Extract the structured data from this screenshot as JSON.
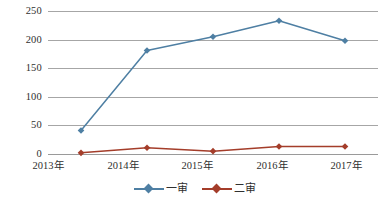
{
  "chart_data": {
    "type": "line",
    "title": "",
    "subtitle": "",
    "xlabel": "",
    "ylabel": "",
    "categories": [
      "2013年",
      "2014年",
      "2015年",
      "2016年",
      "2017年"
    ],
    "yticks": [
      0,
      50,
      100,
      150,
      200,
      250
    ],
    "ylim": [
      0,
      250
    ],
    "grid": "horizontal",
    "legend_position": "bottom-center",
    "markers": "diamond",
    "series": [
      {
        "name": "一审",
        "color": "#4E7FA3",
        "values": [
          41,
          181,
          205,
          233,
          198
        ]
      },
      {
        "name": "二审",
        "color": "#A43D2A",
        "values": [
          2,
          11,
          5,
          13,
          13
        ]
      }
    ]
  },
  "axis": {
    "ytick_labels": [
      "250",
      "200",
      "150",
      "100",
      "50",
      "0"
    ],
    "xtick_labels": [
      "2013年",
      "2014年",
      "2015年",
      "2016年",
      "2017年"
    ]
  },
  "legend": {
    "items": [
      {
        "label": "一审",
        "color": "#4E7FA3"
      },
      {
        "label": "二审",
        "color": "#A43D2A"
      }
    ]
  },
  "colors": {
    "series_one": "#4E7FA3",
    "series_two": "#A43D2A",
    "gridline": "#A6A6A6",
    "text": "#30302F",
    "background": "#FFFFFF"
  }
}
